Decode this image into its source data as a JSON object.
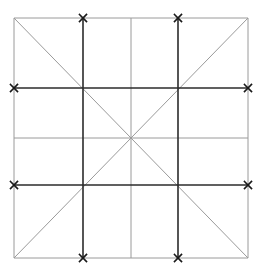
{
  "diagram": {
    "type": "grid-with-diagonals",
    "width": 262,
    "height": 275,
    "colors": {
      "background": "#ffffff",
      "thin_line": "#9a9a9a",
      "thick_line": "#2b2b2b",
      "marker": "#1a1a1a"
    },
    "outer_square": {
      "x1": 14,
      "y1": 18,
      "x2": 248,
      "y2": 258
    },
    "thin_lines": [
      {
        "name": "outer-top",
        "x1": 14,
        "y1": 18,
        "x2": 248,
        "y2": 18
      },
      {
        "name": "outer-bottom",
        "x1": 14,
        "y1": 258,
        "x2": 248,
        "y2": 258
      },
      {
        "name": "outer-left",
        "x1": 14,
        "y1": 18,
        "x2": 14,
        "y2": 258
      },
      {
        "name": "outer-right",
        "x1": 248,
        "y1": 18,
        "x2": 248,
        "y2": 258
      },
      {
        "name": "center-vertical",
        "x1": 131,
        "y1": 18,
        "x2": 131,
        "y2": 258
      },
      {
        "name": "center-horizontal",
        "x1": 14,
        "y1": 138,
        "x2": 248,
        "y2": 138
      },
      {
        "name": "diagonal-main",
        "x1": 14,
        "y1": 18,
        "x2": 248,
        "y2": 258
      },
      {
        "name": "diagonal-anti",
        "x1": 248,
        "y1": 18,
        "x2": 14,
        "y2": 258
      }
    ],
    "thick_lines": [
      {
        "name": "vertical-left",
        "x1": 83,
        "y1": 18,
        "x2": 83,
        "y2": 258
      },
      {
        "name": "vertical-right",
        "x1": 178,
        "y1": 18,
        "x2": 178,
        "y2": 258
      },
      {
        "name": "horizontal-top",
        "x1": 14,
        "y1": 88,
        "x2": 248,
        "y2": 88
      },
      {
        "name": "horizontal-bottom",
        "x1": 14,
        "y1": 185,
        "x2": 248,
        "y2": 185
      }
    ],
    "markers": [
      {
        "name": "marker-top-left",
        "x": 83,
        "y": 18
      },
      {
        "name": "marker-top-right",
        "x": 178,
        "y": 18
      },
      {
        "name": "marker-bottom-left",
        "x": 83,
        "y": 258
      },
      {
        "name": "marker-bottom-right",
        "x": 178,
        "y": 258
      },
      {
        "name": "marker-left-upper",
        "x": 14,
        "y": 88
      },
      {
        "name": "marker-left-lower",
        "x": 14,
        "y": 185
      },
      {
        "name": "marker-right-upper",
        "x": 248,
        "y": 88
      },
      {
        "name": "marker-right-lower",
        "x": 248,
        "y": 185
      }
    ],
    "marker_size": 3.5
  }
}
